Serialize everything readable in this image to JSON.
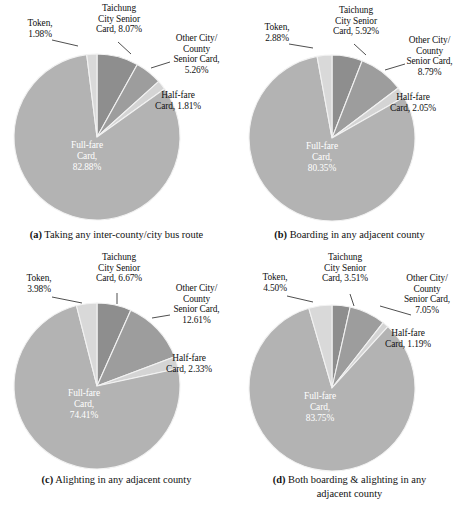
{
  "figure": {
    "panels": [
      {
        "id": "a",
        "tag": "(a)",
        "caption": "Taking any inter-county/city bus route",
        "chart_data": {
          "type": "pie",
          "title": "Taking any inter-county/city bus route",
          "categories": [
            "Taichung City Senior Card",
            "Other City/County Senior Card",
            "Half-fare Card",
            "Full-fare Card",
            "Token"
          ],
          "values": [
            8.07,
            5.26,
            1.81,
            82.88,
            1.98
          ],
          "unit": "%",
          "legend": "none",
          "labels": [
            {
              "name": "taichung-city-senior-card",
              "line1": "Taichung",
              "line2": "City Senior",
              "line3": "Card, 8.07%",
              "value": 8.07
            },
            {
              "name": "other-city-county-senior-card",
              "line1": "Other City/",
              "line2": "County",
              "line3": "Senior Card,",
              "line4": "5.26%",
              "value": 5.26
            },
            {
              "name": "half-fare-card",
              "line1": "Half-fare",
              "line2": "Card, 1.81%",
              "value": 1.81
            },
            {
              "name": "full-fare-card",
              "line1": "Full-fare",
              "line2": "Card,",
              "line3": "82.88%",
              "value": 82.88
            },
            {
              "name": "token",
              "line1": "Token,",
              "line2": "1.98%",
              "value": 1.98
            }
          ]
        }
      },
      {
        "id": "b",
        "tag": "(b)",
        "caption": "Boarding in any adjacent county",
        "chart_data": {
          "type": "pie",
          "title": "Boarding in any adjacent county",
          "categories": [
            "Taichung City Senior Card",
            "Other City/County Senior Card",
            "Half-fare Card",
            "Full-fare Card",
            "Token"
          ],
          "values": [
            5.92,
            8.79,
            2.05,
            80.35,
            2.88
          ],
          "unit": "%",
          "legend": "none",
          "labels": [
            {
              "name": "taichung-city-senior-card",
              "line1": "Taichung",
              "line2": "City Senior",
              "line3": "Card, 5.92%",
              "value": 5.92
            },
            {
              "name": "other-city-county-senior-card",
              "line1": "Other City/",
              "line2": "County",
              "line3": "Senior Card,",
              "line4": "8.79%",
              "value": 8.79
            },
            {
              "name": "half-fare-card",
              "line1": "Half-fare",
              "line2": "Card, 2.05%",
              "value": 2.05
            },
            {
              "name": "full-fare-card",
              "line1": "Full-fare",
              "line2": "Card,",
              "line3": "80.35%",
              "value": 80.35
            },
            {
              "name": "token",
              "line1": "Token,",
              "line2": "2.88%",
              "value": 2.88
            }
          ]
        }
      },
      {
        "id": "c",
        "tag": "(c)",
        "caption": "Alighting in any adjacent county",
        "chart_data": {
          "type": "pie",
          "title": "Alighting in any adjacent county",
          "categories": [
            "Taichung City Senior Card",
            "Other City/County Senior Card",
            "Half-fare Card",
            "Full-fare Card",
            "Token"
          ],
          "values": [
            6.67,
            12.61,
            2.33,
            74.41,
            3.98
          ],
          "unit": "%",
          "legend": "none",
          "labels": [
            {
              "name": "taichung-city-senior-card",
              "line1": "Taichung",
              "line2": "City Senior",
              "line3": "Card, 6.67%",
              "value": 6.67
            },
            {
              "name": "other-city-county-senior-card",
              "line1": "Other City/",
              "line2": "County",
              "line3": "Senior Card,",
              "line4": "12.61%",
              "value": 12.61
            },
            {
              "name": "half-fare-card",
              "line1": "Half-fare",
              "line2": "Card, 2.33%",
              "value": 2.33
            },
            {
              "name": "full-fare-card",
              "line1": "Full-fare",
              "line2": "Card,",
              "line3": "74.41%",
              "value": 74.41
            },
            {
              "name": "token",
              "line1": "Token,",
              "line2": "3.98%",
              "value": 3.98
            }
          ]
        }
      },
      {
        "id": "d",
        "tag": "(d)",
        "caption": "Both boarding & alighting in any",
        "caption2": "adjacent county",
        "chart_data": {
          "type": "pie",
          "title": "Both boarding & alighting in any adjacent county",
          "categories": [
            "Taichung City Senior Card",
            "Other City/County Senior Card",
            "Half-fare Card",
            "Full-fare Card",
            "Token"
          ],
          "values": [
            3.51,
            7.05,
            1.19,
            83.75,
            4.5
          ],
          "unit": "%",
          "legend": "none",
          "labels": [
            {
              "name": "taichung-city-senior-card",
              "line1": "Taichung",
              "line2": "City Senior",
              "line3": "Card, 3.51%",
              "value": 3.51
            },
            {
              "name": "other-city-county-senior-card",
              "line1": "Other City/",
              "line2": "County",
              "line3": "Senior Card,",
              "line4": "7.05%",
              "value": 7.05
            },
            {
              "name": "half-fare-card",
              "line1": "Half-fare",
              "line2": "Card, 1.19%",
              "value": 1.19
            },
            {
              "name": "full-fare-card",
              "line1": "Full-fare",
              "line2": "Card,",
              "line3": "83.75%",
              "value": 83.75
            },
            {
              "name": "token",
              "line1": "Token,",
              "line2": "4.50%",
              "value": 4.5
            }
          ]
        }
      }
    ],
    "colors": {
      "taichung_city_senior_card": "#8e8e8e",
      "other_city_county_senior_card": "#9d9d9d",
      "half_fare_card": "#d4d4d4",
      "full_fare_card": "#b3b3b3",
      "token": "#d9d9d9",
      "slice_outline": "#f2f2f2",
      "text": "#111111",
      "inner_text": "#ffffff",
      "background": "#ffffff"
    }
  }
}
